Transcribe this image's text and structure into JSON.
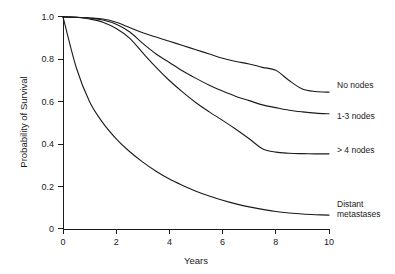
{
  "chart_data": {
    "type": "line",
    "title": "",
    "subtitle": "",
    "xlabel": "Years",
    "ylabel": "Probability of Survival",
    "xlim": [
      0,
      10
    ],
    "ylim": [
      0,
      1.0
    ],
    "grid": false,
    "legend_position": "right-inline-labels",
    "xticks": [
      0,
      2,
      4,
      6,
      8,
      10
    ],
    "xtick_labels": [
      "0",
      "2",
      "4",
      "6",
      "8",
      "10"
    ],
    "yticks": [
      0,
      0.2,
      0.4,
      0.6,
      0.8,
      1.0
    ],
    "ytick_labels": [
      "0",
      "0.2",
      "0.4",
      "0.6",
      "0.8",
      "1.0"
    ],
    "x": [
      0,
      0.5,
      1,
      1.5,
      2,
      2.5,
      3,
      3.5,
      4,
      4.5,
      5,
      5.5,
      6,
      6.5,
      7,
      7.5,
      8,
      8.5,
      9,
      9.5,
      10
    ],
    "series": [
      {
        "name": "No nodes",
        "label": "No nodes",
        "label_x": 10.25,
        "label_y": 0.645,
        "values": [
          1.0,
          0.998,
          0.995,
          0.99,
          0.975,
          0.95,
          0.925,
          0.905,
          0.885,
          0.865,
          0.845,
          0.825,
          0.805,
          0.79,
          0.778,
          0.762,
          0.748,
          0.7,
          0.66,
          0.648,
          0.645
        ]
      },
      {
        "name": "1-3 nodes",
        "label": "1-3 nodes",
        "label_x": 10.25,
        "label_y": 0.545,
        "values": [
          1.0,
          0.998,
          0.995,
          0.985,
          0.965,
          0.93,
          0.875,
          0.825,
          0.785,
          0.745,
          0.71,
          0.678,
          0.65,
          0.625,
          0.605,
          0.585,
          0.572,
          0.56,
          0.552,
          0.546,
          0.543
        ]
      },
      {
        "name": "> 4 nodes",
        "label": "> 4 nodes",
        "label_x": 10.25,
        "label_y": 0.355,
        "values": [
          1.0,
          0.998,
          0.99,
          0.975,
          0.945,
          0.9,
          0.83,
          0.762,
          0.7,
          0.645,
          0.595,
          0.552,
          0.512,
          0.47,
          0.425,
          0.378,
          0.362,
          0.357,
          0.355,
          0.354,
          0.354
        ]
      },
      {
        "name": "Distant metastases",
        "label": "Distant",
        "label_line2": "metastases",
        "label_x": 10.25,
        "label_y": 0.095,
        "values": [
          1.0,
          0.76,
          0.6,
          0.5,
          0.425,
          0.365,
          0.315,
          0.272,
          0.235,
          0.205,
          0.178,
          0.155,
          0.135,
          0.118,
          0.104,
          0.092,
          0.082,
          0.075,
          0.07,
          0.067,
          0.065
        ]
      }
    ]
  },
  "axes": {
    "y_title": "Probability of Survival",
    "x_title": "Years"
  }
}
